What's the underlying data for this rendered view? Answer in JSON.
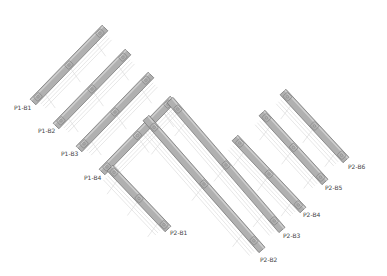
{
  "diagram": {
    "type": "isometric-structural-beam-layout",
    "colors": {
      "background": "#ffffff",
      "beam_fill": "#b0b0b0",
      "beam_top": "#cfcfcf",
      "beam_edge": "#6e6e6e",
      "connector": "#8a8a8a",
      "guide_line": "#d6d6d6",
      "label": "#444444"
    },
    "groups": [
      {
        "name": "P1",
        "beams": [
          {
            "id": "P1-B1",
            "label": "P1-B1",
            "x1": 33,
            "y1": 102,
            "x2": 105,
            "y2": 28,
            "label_x": 14,
            "label_y": 110
          },
          {
            "id": "P1-B2",
            "label": "P1-B2",
            "x1": 56,
            "y1": 126,
            "x2": 128,
            "y2": 52,
            "label_x": 38,
            "label_y": 133
          },
          {
            "id": "P1-B3",
            "label": "P1-B3",
            "x1": 79,
            "y1": 149,
            "x2": 151,
            "y2": 75,
            "label_x": 61,
            "label_y": 156
          },
          {
            "id": "P1-B4",
            "label": "P1-B4",
            "x1": 102,
            "y1": 172,
            "x2": 173,
            "y2": 99,
            "label_x": 84,
            "label_y": 180
          }
        ]
      },
      {
        "name": "P2",
        "beams": [
          {
            "id": "P2-B1",
            "label": "P2-B1",
            "x1": 110,
            "y1": 168,
            "x2": 168,
            "y2": 229,
            "label_x": 170,
            "label_y": 235
          },
          {
            "id": "P2-B2",
            "label": "P2-B2",
            "x1": 146,
            "y1": 118,
            "x2": 262,
            "y2": 250,
            "label_x": 260,
            "label_y": 262
          },
          {
            "id": "P2-B3",
            "label": "P2-B3",
            "x1": 170,
            "y1": 100,
            "x2": 282,
            "y2": 230,
            "label_x": 283,
            "label_y": 238
          },
          {
            "id": "P2-B4",
            "label": "P2-B4",
            "x1": 235,
            "y1": 138,
            "x2": 303,
            "y2": 210,
            "label_x": 303,
            "label_y": 217
          },
          {
            "id": "P2-B5",
            "label": "P2-B5",
            "x1": 262,
            "y1": 113,
            "x2": 325,
            "y2": 182,
            "label_x": 325,
            "label_y": 190
          },
          {
            "id": "P2-B6",
            "label": "P2-B6",
            "x1": 283,
            "y1": 92,
            "x2": 346,
            "y2": 160,
            "label_x": 348,
            "label_y": 169
          }
        ]
      }
    ]
  }
}
